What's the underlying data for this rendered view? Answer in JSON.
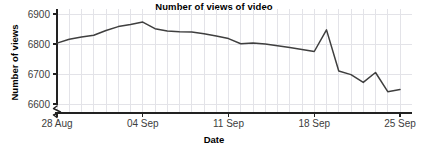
{
  "chart_data": {
    "type": "line",
    "title": "Number of views of video",
    "xlabel": "Date",
    "ylabel": "Number of views",
    "grid": true,
    "legend": "none",
    "y_axis_break": true,
    "ylim": [
      6560,
      6910
    ],
    "yticks": [
      6600,
      6700,
      6800,
      6900
    ],
    "ytick_labels": [
      "6600",
      "6700",
      "6800",
      "6900"
    ],
    "xticks": [
      "28 Aug",
      "04 Sep",
      "11 Sep",
      "18 Sep",
      "25 Sep"
    ],
    "xtick_labels": [
      "28 Aug",
      "04 Sep",
      "11 Sep",
      "18 Sep",
      "25 Sep"
    ],
    "x": [
      "28 Aug",
      "29 Aug",
      "30 Aug",
      "31 Aug",
      "01 Sep",
      "02 Sep",
      "03 Sep",
      "04 Sep",
      "05 Sep",
      "06 Sep",
      "07 Sep",
      "08 Sep",
      "09 Sep",
      "10 Sep",
      "11 Sep",
      "12 Sep",
      "13 Sep",
      "14 Sep",
      "15 Sep",
      "16 Sep",
      "17 Sep",
      "18 Sep",
      "19 Sep",
      "20 Sep",
      "21 Sep",
      "22 Sep",
      "23 Sep",
      "24 Sep",
      "25 Sep"
    ],
    "series": [
      {
        "name": "Number of views",
        "color": "#3f3f3f",
        "values": [
          6803,
          6816,
          6823,
          6829,
          6845,
          6858,
          6865,
          6873,
          6851,
          6843,
          6841,
          6840,
          6834,
          6827,
          6818,
          6801,
          6803,
          6800,
          6794,
          6788,
          6782,
          6775,
          6847,
          6710,
          6698,
          6672,
          6705,
          6641,
          6648
        ]
      }
    ],
    "colors": {
      "line": "#3f3f3f",
      "axis": "#222222",
      "grid": "#e3e3e8",
      "tick_text": "#3d3d3d",
      "title_text": "#000000",
      "background": "#ffffff"
    }
  }
}
